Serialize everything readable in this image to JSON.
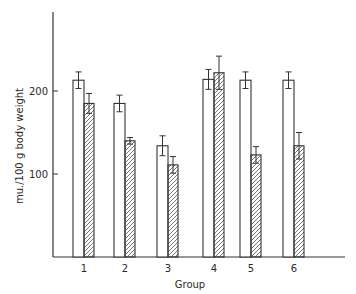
{
  "chart_data": {
    "type": "bar",
    "title": "",
    "xlabel": "Group",
    "ylabel": "mu./100 g body weight",
    "categories": [
      "1",
      "2",
      "3",
      "4",
      "5",
      "6"
    ],
    "yticks": [
      100,
      200
    ],
    "ylim": [
      0,
      295
    ],
    "grid": false,
    "legend": "none",
    "series": [
      {
        "name": "open",
        "fill": "open",
        "values": [
          213,
          185,
          134,
          214,
          213,
          213
        ],
        "errors": [
          10,
          10,
          12,
          12,
          10,
          10
        ]
      },
      {
        "name": "hatched",
        "fill": "hatched",
        "values": [
          185,
          140,
          111,
          222,
          123,
          134
        ],
        "errors": [
          12,
          4,
          10,
          20,
          10,
          16
        ]
      }
    ]
  },
  "colors": {
    "ink": "#333333",
    "background": "#ffffff"
  }
}
